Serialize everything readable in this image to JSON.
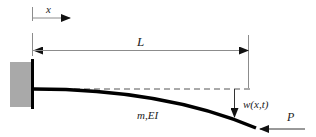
{
  "diagram": {
    "type": "cantilever-beam",
    "labels": {
      "x_axis": "x",
      "length": "L",
      "properties": "m,EI",
      "deflection": "w(x,t)",
      "load": "P"
    },
    "colors": {
      "wall_fill": "#a9a9a9",
      "beam": "#000000",
      "dimension_lines": "#8c8c8c",
      "dashed_reference": "#555555",
      "text": "#222222"
    }
  }
}
